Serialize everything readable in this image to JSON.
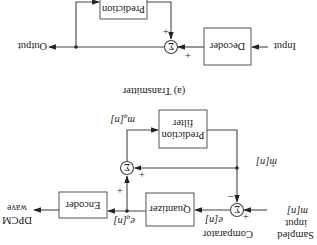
{
  "orientation": "rotated 180 degrees",
  "transmitter": {
    "caption": "(a) Transmitter",
    "input_label": [
      "Sampled",
      "input",
      "m[n]"
    ],
    "comparator_label": "Comparator",
    "comparator_symbol": "Σ",
    "comparator_signs": {
      "plus": "+",
      "minus": "−"
    },
    "error_label": "e[n]",
    "quantizer_label": "Quantizer",
    "quantized_error_label": "e_q[n]",
    "encoder_label": "Encoder",
    "output_label": [
      "DPCM",
      "wave"
    ],
    "summer_symbol": "Σ",
    "summer_signs": {
      "left": "+",
      "bottom": "+"
    },
    "prediction_filter_label": [
      "Prediction",
      "filter"
    ],
    "mq_label": "m_q[n]",
    "prediction_label": "m̂[n]"
  },
  "receiver": {
    "input_label": "Input",
    "decoder_label": "Decoder",
    "summer_symbol": "Σ",
    "summer_signs": {
      "left": "+",
      "bottom": "+"
    },
    "prediction_label": "Prediction",
    "output_label": "Output"
  }
}
